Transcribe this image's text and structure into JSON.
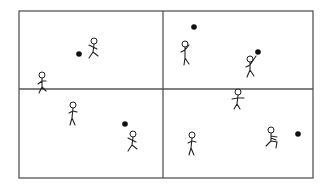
{
  "diagram": {
    "frame": {
      "x": 19,
      "y": 11,
      "width": 294,
      "height": 167,
      "color": "#555555"
    },
    "dividers": {
      "vertical_x": 163,
      "horizontal_y": 89
    },
    "colors": {
      "stroke": "#222222",
      "ball": "#111111",
      "frame": "#555555"
    },
    "panels": [
      {
        "id": "top-left",
        "balls": [
          {
            "x": 79,
            "y": 54
          }
        ],
        "figures": [
          {
            "x": 94,
            "y": 52,
            "pose": "running"
          },
          {
            "x": 42,
            "y": 86,
            "pose": "holding-ball"
          }
        ]
      },
      {
        "id": "top-right",
        "balls": [
          {
            "x": 194,
            "y": 27
          },
          {
            "x": 258,
            "y": 52
          }
        ],
        "figures": [
          {
            "x": 185,
            "y": 55,
            "pose": "reaching-up"
          },
          {
            "x": 250,
            "y": 70,
            "pose": "throwing"
          }
        ]
      },
      {
        "id": "bottom-left",
        "balls": [
          {
            "x": 125,
            "y": 124
          }
        ],
        "figures": [
          {
            "x": 73,
            "y": 116,
            "pose": "standing"
          },
          {
            "x": 133,
            "y": 145,
            "pose": "running"
          }
        ]
      },
      {
        "id": "bottom-right",
        "balls": [
          {
            "x": 298,
            "y": 134
          }
        ],
        "figures": [
          {
            "x": 238,
            "y": 103,
            "pose": "arms-out"
          },
          {
            "x": 192,
            "y": 146,
            "pose": "standing"
          },
          {
            "x": 271,
            "y": 141,
            "pose": "kicking"
          }
        ]
      }
    ]
  }
}
